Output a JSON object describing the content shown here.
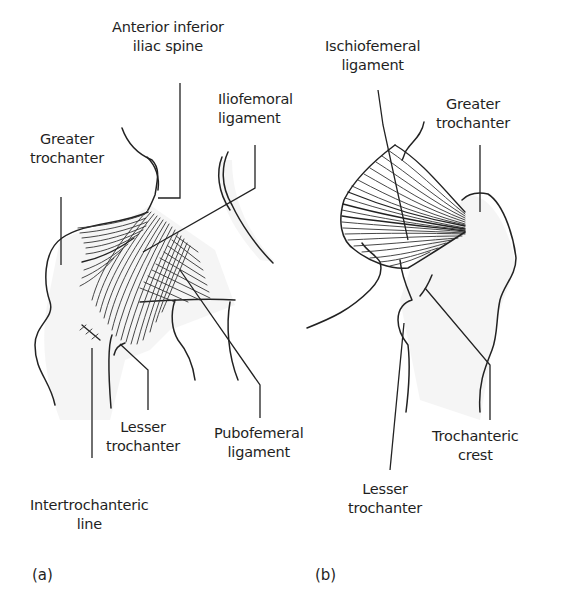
{
  "figure": {
    "panels": [
      {
        "id": "a",
        "tag": "(a)",
        "view": "anterior",
        "labels": [
          {
            "key": "aiis",
            "lines": [
              "Anterior inferior",
              "iliac spine"
            ]
          },
          {
            "key": "greater_trochanter",
            "lines": [
              "Greater",
              "trochanter"
            ]
          },
          {
            "key": "iliofemoral",
            "lines": [
              "Iliofemoral",
              "ligament"
            ]
          },
          {
            "key": "lesser_trochanter",
            "lines": [
              "Lesser",
              "trochanter"
            ]
          },
          {
            "key": "pubofemoral",
            "lines": [
              "Pubofemeral",
              "ligament"
            ]
          },
          {
            "key": "intertrochanteric_line",
            "lines": [
              "Intertrochanteric",
              "line"
            ]
          }
        ]
      },
      {
        "id": "b",
        "tag": "(b)",
        "view": "posterior",
        "labels": [
          {
            "key": "ischiofemoral",
            "lines": [
              "Ischiofemeral",
              "ligament"
            ]
          },
          {
            "key": "greater_trochanter",
            "lines": [
              "Greater",
              "trochanter"
            ]
          },
          {
            "key": "trochanteric_crest",
            "lines": [
              "Trochanteric",
              "crest"
            ]
          },
          {
            "key": "lesser_trochanter",
            "lines": [
              "Lesser",
              "trochanter"
            ]
          }
        ]
      }
    ],
    "colors": {
      "line": "#222222",
      "background": "#ffffff",
      "shading": "#ececec"
    }
  }
}
